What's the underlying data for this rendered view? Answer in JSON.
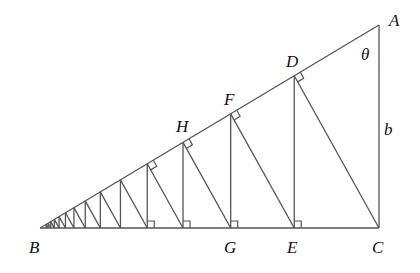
{
  "diagram": {
    "type": "geometry",
    "labels": {
      "A": "A",
      "B": "B",
      "C": "C",
      "D": "D",
      "E": "E",
      "F": "F",
      "G": "G",
      "H": "H",
      "theta": "θ",
      "b": "b"
    },
    "points": {
      "B": [
        40,
        228
      ],
      "C": [
        379,
        228
      ],
      "A": [
        379,
        25
      ]
    },
    "ratio": 0.75,
    "steps": 14,
    "right_angle_marks_base": 4,
    "right_angle_marks_hypotenuse": 4,
    "colors": {
      "line": "#555555",
      "text": "#111111",
      "background": "#ffffff"
    }
  }
}
